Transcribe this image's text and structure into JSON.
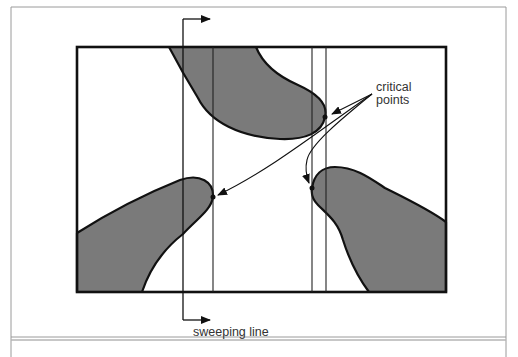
{
  "figure": {
    "labels": {
      "critical_points_line1": "critical",
      "critical_points_line2": "points",
      "sweeping_line": "sweeping line"
    },
    "colors": {
      "background": "#ffffff",
      "obstacle_fill": "#7a7a7a",
      "stroke": "#111111",
      "frame": "#8a8a8a",
      "text": "#333333"
    },
    "elements": {
      "workspace_rectangle": "bounded workspace",
      "obstacles": [
        "top obstacle",
        "left obstacle",
        "right obstacle"
      ],
      "critical_point_count": 3,
      "vertical_lines": [
        "sweeping line",
        "critical line 1",
        "critical line 2",
        "critical line 3"
      ]
    }
  }
}
